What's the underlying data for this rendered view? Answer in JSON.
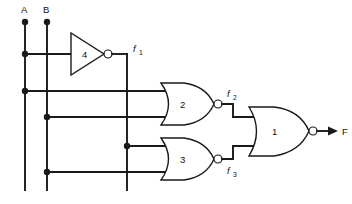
{
  "diagram": {
    "type": "logic-circuit-schematic",
    "title": "",
    "background_color": "#ffffff",
    "line_color": "#1a1a1a",
    "inputs": [
      {
        "id": "A",
        "label": "A",
        "rail_x": 25,
        "terminal_y": 22
      },
      {
        "id": "B",
        "label": "B",
        "rail_x": 47,
        "terminal_y": 22
      }
    ],
    "outputs": [
      {
        "id": "F",
        "label": "F",
        "arrow": true
      }
    ],
    "signals": [
      {
        "id": "f1",
        "label": "f",
        "subscript": "1",
        "source_gate": "4"
      },
      {
        "id": "f2",
        "label": "f",
        "subscript": "2",
        "source_gate": "2"
      },
      {
        "id": "f3",
        "label": "f",
        "subscript": "3",
        "source_gate": "3"
      }
    ],
    "gates": [
      {
        "number": "4",
        "label": "4",
        "kind": "inverter",
        "inputs": [
          "A"
        ],
        "output": "f1"
      },
      {
        "number": "2",
        "label": "2",
        "kind": "nor",
        "inputs": [
          "A",
          "B"
        ],
        "output": "f2"
      },
      {
        "number": "3",
        "label": "3",
        "kind": "nor",
        "inputs": [
          "f1",
          "B"
        ],
        "output": "f3"
      },
      {
        "number": "1",
        "label": "1",
        "kind": "nor",
        "inputs": [
          "f2",
          "f3"
        ],
        "output": "F"
      }
    ],
    "junction_dots": [
      {
        "on": "A",
        "x": 25,
        "y": 22
      },
      {
        "on": "B",
        "x": 47,
        "y": 22
      },
      {
        "on": "A",
        "x": 25,
        "y": 54
      },
      {
        "on": "A",
        "x": 25,
        "y": 91
      },
      {
        "on": "B",
        "x": 47,
        "y": 117
      },
      {
        "on": "f1",
        "x": 127,
        "y": 146
      },
      {
        "on": "B",
        "x": 47,
        "y": 172
      }
    ]
  }
}
